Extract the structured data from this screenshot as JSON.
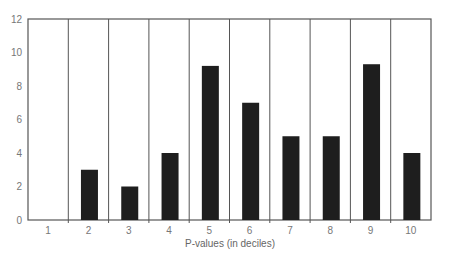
{
  "chart_data": {
    "type": "bar",
    "title": "",
    "xlabel": "P-values (in deciles)",
    "ylabel": "",
    "categories": [
      "1",
      "2",
      "3",
      "4",
      "5",
      "6",
      "7",
      "8",
      "9",
      "10"
    ],
    "values": [
      0,
      3,
      2,
      4,
      9.2,
      7,
      5,
      5,
      9.3,
      4
    ],
    "ylim": [
      0,
      12
    ],
    "yticks": [
      0,
      2,
      4,
      6,
      8,
      10,
      12
    ],
    "grid": "vertical separators between categories",
    "legend": null,
    "colors": {
      "bar": "#1e1e1e",
      "axis": "#555555",
      "text": "#777777"
    }
  }
}
